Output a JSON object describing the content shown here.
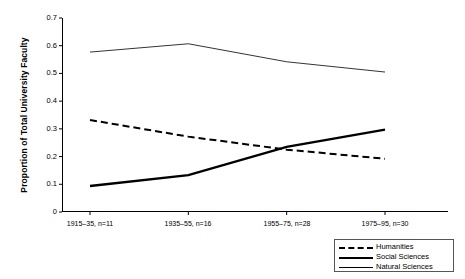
{
  "chart_data": {
    "type": "line",
    "title": "",
    "xlabel": "",
    "ylabel": "Proportion of Total University Faculty",
    "categories": [
      "1915–35, n=11",
      "1935–55, n=16",
      "1955–75, n=28",
      "1975–95, n=30"
    ],
    "ylim": [
      0,
      0.7
    ],
    "yticks": [
      "0",
      "0.1",
      "0.2",
      "0.3",
      "0.4",
      "0.5",
      "0.6",
      "0.7"
    ],
    "ytick_values": [
      0,
      0.1,
      0.2,
      0.3,
      0.4,
      0.5,
      0.6,
      0.7
    ],
    "grid": false,
    "legend_position": "bottom-right",
    "series": [
      {
        "name": "Humanities",
        "style": "dashed",
        "values": [
          0.332,
          0.272,
          0.225,
          0.192
        ]
      },
      {
        "name": "Social Sciences",
        "style": "solid-thick",
        "values": [
          0.094,
          0.133,
          0.235,
          0.297
        ]
      },
      {
        "name": "Natural Sciences",
        "style": "solid-thin",
        "values": [
          0.577,
          0.607,
          0.542,
          0.505
        ]
      }
    ]
  },
  "axes": {
    "y_title": "Proportion of Total University Faculty",
    "y_labels": [
      "0.7",
      "0.6",
      "0.5",
      "0.4",
      "0.3",
      "0.2",
      "0.1",
      "0"
    ],
    "x_labels": [
      "1915–35, n=11",
      "1935–55, n=16",
      "1955–75, n=28",
      "1975–95, n=30"
    ]
  },
  "legend": {
    "items": [
      {
        "label": "Humanities"
      },
      {
        "label": "Social Sciences"
      },
      {
        "label": "Natural Sciences"
      }
    ]
  },
  "colors": {
    "ink": "#000000",
    "frame": "#555555",
    "background": "#ffffff"
  }
}
